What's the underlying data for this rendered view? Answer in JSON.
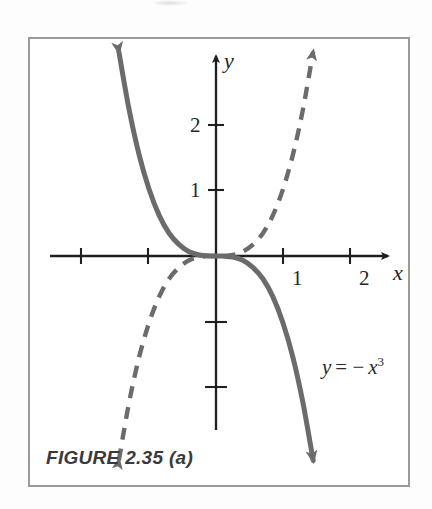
{
  "figure": {
    "caption": "FIGURE 2.35 (a)",
    "frame_color": "#9a9a9a",
    "background": "#ffffff"
  },
  "axes": {
    "x_label": "x",
    "y_label": "y",
    "axis_color": "#1f1f1f",
    "x_tick_labels": [
      "1",
      "2"
    ],
    "y_tick_labels": [
      "1",
      "2"
    ],
    "x_ticks_values": [
      -2,
      -1,
      1,
      2
    ],
    "y_ticks_values": [
      -2,
      -1,
      1,
      2
    ],
    "origin_px": [
      216,
      256
    ],
    "unit_px": 67
  },
  "labels": {
    "equation_y": "y",
    "equation_eq": "= −",
    "equation_x": "x",
    "equation_exp": "3"
  },
  "chart_data": {
    "type": "line",
    "title": "FIGURE 2.35 (a)",
    "xlabel": "x",
    "ylabel": "y",
    "xlim": [
      -2.5,
      2.6
    ],
    "ylim": [
      -2.7,
      3.1
    ],
    "grid": false,
    "legend": "none",
    "annotations": [
      {
        "text": "y = − x³",
        "x": 1.5,
        "y": -1.55,
        "series": "solid-curve"
      }
    ],
    "series": [
      {
        "name": "y = -x^3",
        "style": "solid",
        "color": "#6b6b6b",
        "arrow_start": true,
        "arrow_end": true,
        "x": [
          -1.45,
          -1.3,
          -1.15,
          -1.0,
          -0.85,
          -0.7,
          -0.55,
          -0.4,
          -0.25,
          -0.1,
          0,
          0.1,
          0.25,
          0.4,
          0.55,
          0.7,
          0.85,
          1.0,
          1.15,
          1.3,
          1.45
        ],
        "y": [
          3.05,
          2.2,
          1.52,
          1.0,
          0.61,
          0.34,
          0.17,
          0.064,
          0.016,
          0.001,
          0,
          -0.001,
          -0.016,
          -0.064,
          -0.17,
          -0.34,
          -0.61,
          -1.0,
          -1.52,
          -2.2,
          -3.05
        ]
      },
      {
        "name": "y = x^3",
        "style": "dashed",
        "color": "#6b6b6b",
        "arrow_start": true,
        "arrow_end": true,
        "x": [
          -1.45,
          -1.3,
          -1.15,
          -1.0,
          -0.85,
          -0.7,
          -0.55,
          -0.4,
          -0.25,
          -0.1,
          0,
          0.1,
          0.25,
          0.4,
          0.55,
          0.7,
          0.85,
          1.0,
          1.15,
          1.3,
          1.45
        ],
        "y": [
          -3.05,
          -2.2,
          -1.52,
          -1.0,
          -0.61,
          -0.34,
          -0.17,
          -0.064,
          -0.016,
          -0.001,
          0,
          0.001,
          0.016,
          0.064,
          0.17,
          0.34,
          0.61,
          1.0,
          1.52,
          2.2,
          3.05
        ]
      }
    ]
  }
}
